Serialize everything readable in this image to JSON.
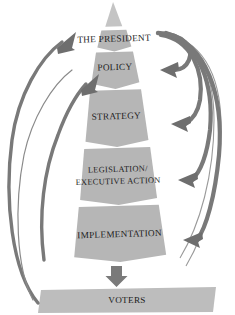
{
  "diagram": {
    "type": "pyramid-flow",
    "colors": {
      "layer_fill": "#b4b4b4",
      "layer_fill_light": "#bcbcbc",
      "apex_fill": "#c2c2c2",
      "arrow_fill": "#6e6e6e",
      "arrow_fill_light": "#8a8a8a",
      "text": "#1b1b1b",
      "background": "#ffffff"
    },
    "apex": {
      "name": "pyramid-apex",
      "label": ""
    },
    "layers": [
      {
        "id": "president",
        "label": "THE PRESIDENT",
        "level": 1
      },
      {
        "id": "policy",
        "label": "POLICY",
        "level": 2
      },
      {
        "id": "strategy",
        "label": "STRATEGY",
        "level": 3
      },
      {
        "id": "legislation",
        "label_line1": "LEGISLATION/",
        "label_line2": "EXECUTIVE ACTION",
        "level": 4
      },
      {
        "id": "implementation",
        "label": "IMPLEMENTATION",
        "level": 5
      },
      {
        "id": "voters",
        "label": "VOTERS",
        "level": 6
      }
    ],
    "connectors": {
      "down_arrow": {
        "name": "implementation-to-voters-arrow",
        "direction": "down"
      },
      "feedback_arrows_left": [
        {
          "name": "voters-to-president-arrow",
          "direction": "up-right",
          "from": "voters",
          "to": "president"
        },
        {
          "name": "voters-to-policy-arrow",
          "direction": "up-right",
          "from": "voters",
          "to": "policy"
        }
      ],
      "feedback_arrows_right": [
        {
          "name": "president-to-policy-arrow",
          "direction": "down-left",
          "from": "president",
          "to": "policy"
        },
        {
          "name": "president-to-strategy-arrow",
          "direction": "down-left",
          "from": "president",
          "to": "strategy"
        },
        {
          "name": "president-to-legislation-arrow",
          "direction": "down-left",
          "from": "president",
          "to": "legislation"
        },
        {
          "name": "president-to-implementation-arrow",
          "direction": "down-left",
          "from": "president",
          "to": "implementation"
        }
      ]
    }
  }
}
